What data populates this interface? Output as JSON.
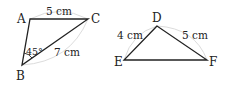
{
  "figures": [
    {
      "name": "triangle-ABC",
      "vertices": {
        "A": {
          "label": "A",
          "x": 30,
          "y": 19
        },
        "B": {
          "label": "B",
          "x": 22,
          "y": 65
        },
        "C": {
          "label": "C",
          "x": 88,
          "y": 19
        }
      },
      "sides": {
        "AC": {
          "label": "5 cm"
        },
        "BC": {
          "label": "7 cm"
        }
      },
      "angles": {
        "B": {
          "label": "45°"
        }
      }
    },
    {
      "name": "triangle-DEF",
      "vertices": {
        "D": {
          "label": "D",
          "x": 157,
          "y": 26
        },
        "E": {
          "label": "E",
          "x": 124,
          "y": 60
        },
        "F": {
          "label": "F",
          "x": 207,
          "y": 60
        }
      },
      "sides": {
        "DE": {
          "label": "4 cm"
        },
        "DF": {
          "label": "5 cm"
        }
      }
    }
  ],
  "colors": {
    "line": "#222222",
    "arc": "#d8d8d8"
  }
}
